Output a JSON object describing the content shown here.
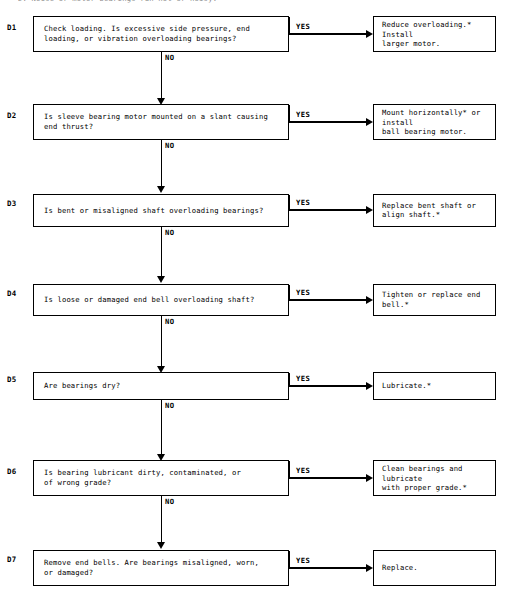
{
  "header": {
    "caption": "D.  Noise or motor bearings run hot or noisy."
  },
  "labels": {
    "yes": "YES",
    "no": "NO"
  },
  "steps": [
    {
      "id": "D1",
      "question": "Check loading.  Is excessive side pressure, end\nloading, or vibration overloading bearings?",
      "action": "Reduce overloading.*  Install\nlarger motor."
    },
    {
      "id": "D2",
      "question": "Is sleeve bearing motor mounted on a slant causing\nend thrust?",
      "action": "Mount horizontally* or install\nball bearing motor."
    },
    {
      "id": "D3",
      "question": "Is bent or misaligned shaft overloading bearings?",
      "action": "Replace bent shaft or\nalign shaft.*"
    },
    {
      "id": "D4",
      "question": "Is loose or damaged end bell overloading shaft?",
      "action": "Tighten or replace end bell.*"
    },
    {
      "id": "D5",
      "question": "Are bearings dry?",
      "action": "Lubricate.*"
    },
    {
      "id": "D6",
      "question": "Is bearing lubricant dirty, contaminated, or\nof wrong grade?",
      "action": "Clean bearings and lubricate\nwith proper grade.*"
    },
    {
      "id": "D7",
      "question": "Remove end bells.  Are bearings misaligned, worn,\nor damaged?",
      "action": "Replace."
    }
  ],
  "geometry": {
    "rows": [
      {
        "box_top": 16,
        "box_height": 36,
        "label_top": 24,
        "yes_top": 23,
        "arrow_y": 33,
        "no_top": 54,
        "vline_top": 52,
        "vline_height": 46
      },
      {
        "box_top": 104,
        "box_height": 36,
        "label_top": 112,
        "yes_top": 111,
        "arrow_y": 121,
        "no_top": 142,
        "vline_top": 140,
        "vline_height": 46
      },
      {
        "box_top": 194,
        "box_height": 33,
        "label_top": 200,
        "yes_top": 199,
        "arrow_y": 209,
        "no_top": 229,
        "vline_top": 227,
        "vline_height": 49
      },
      {
        "box_top": 284,
        "box_height": 32,
        "label_top": 290,
        "yes_top": 289,
        "arrow_y": 299,
        "no_top": 318,
        "vline_top": 316,
        "vline_height": 50
      },
      {
        "box_top": 372,
        "box_height": 28,
        "label_top": 376,
        "yes_top": 375,
        "arrow_y": 385,
        "no_top": 402,
        "vline_top": 400,
        "vline_height": 54
      },
      {
        "box_top": 460,
        "box_height": 36,
        "label_top": 468,
        "yes_top": 467,
        "arrow_y": 477,
        "no_top": 498,
        "vline_top": 496,
        "vline_height": 46
      },
      {
        "box_top": 550,
        "box_height": 36,
        "label_top": 556,
        "yes_top": 557,
        "arrow_y": 567,
        "no_top": 0,
        "vline_top": 0,
        "vline_height": 0
      }
    ]
  }
}
